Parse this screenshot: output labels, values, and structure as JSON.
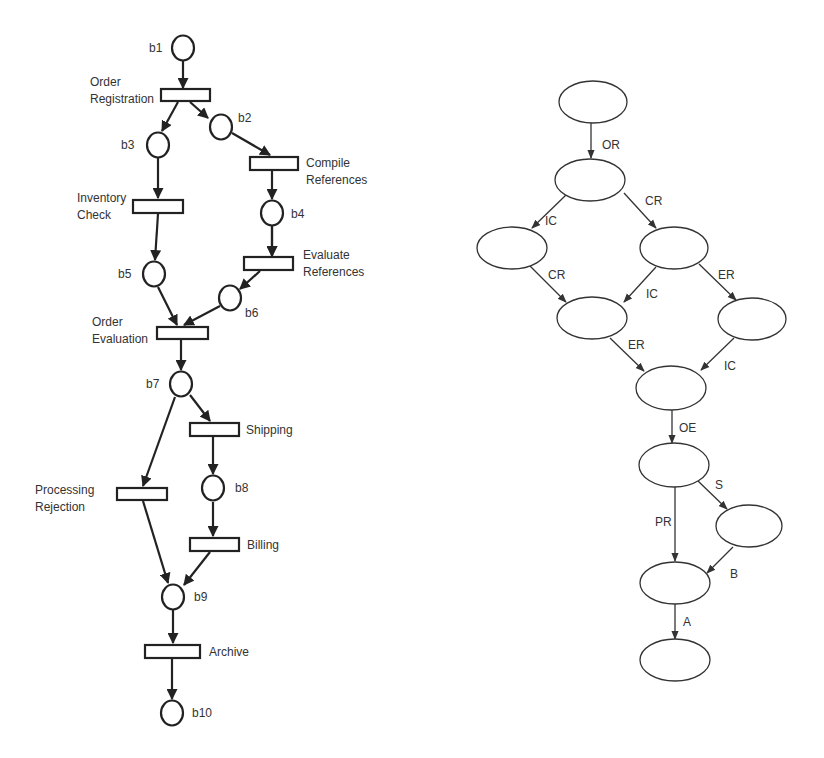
{
  "petri_net": {
    "places": [
      {
        "id": "b1",
        "label": "b1",
        "cx": 183,
        "cy": 48,
        "lx": 149,
        "ly": 52,
        "anchor": "start"
      },
      {
        "id": "b2",
        "label": "b2",
        "cx": 221,
        "cy": 127,
        "lx": 238,
        "ly": 122,
        "anchor": "start"
      },
      {
        "id": "b3",
        "label": "b3",
        "cx": 158,
        "cy": 145,
        "lx": 121,
        "ly": 149,
        "anchor": "start"
      },
      {
        "id": "b4",
        "label": "b4",
        "cx": 272,
        "cy": 213,
        "lx": 291,
        "ly": 218,
        "anchor": "start"
      },
      {
        "id": "b5",
        "label": "b5",
        "cx": 154,
        "cy": 274,
        "lx": 118,
        "ly": 278,
        "anchor": "start"
      },
      {
        "id": "b6",
        "label": "b6",
        "cx": 230,
        "cy": 298,
        "lx": 245,
        "ly": 317,
        "anchor": "start"
      },
      {
        "id": "b7",
        "label": "b7",
        "cx": 181,
        "cy": 384,
        "lx": 146,
        "ly": 388,
        "anchor": "start"
      },
      {
        "id": "b8",
        "label": "b8",
        "cx": 213,
        "cy": 488,
        "lx": 235,
        "ly": 492,
        "anchor": "start"
      },
      {
        "id": "b9",
        "label": "b9",
        "cx": 173,
        "cy": 597,
        "lx": 194,
        "ly": 601,
        "anchor": "start"
      },
      {
        "id": "b10",
        "label": "b10",
        "cx": 172,
        "cy": 713,
        "lx": 192,
        "ly": 717,
        "anchor": "start"
      }
    ],
    "transitions": [
      {
        "id": "OR",
        "lines": [
          "Order",
          "Registration"
        ],
        "x": 161,
        "y": 89,
        "w": 49,
        "h": 12,
        "lx": 90,
        "ly": 86,
        "anchor": "start"
      },
      {
        "id": "CR",
        "lines": [
          "Compile",
          "References"
        ],
        "x": 250,
        "y": 157,
        "w": 48,
        "h": 13,
        "lx": 306,
        "ly": 167,
        "anchor": "start"
      },
      {
        "id": "IC",
        "lines": [
          "Inventory",
          "Check"
        ],
        "x": 133,
        "y": 200,
        "w": 50,
        "h": 13,
        "lx": 77,
        "ly": 202,
        "anchor": "start"
      },
      {
        "id": "ER",
        "lines": [
          "Evaluate",
          "References"
        ],
        "x": 244,
        "y": 257,
        "w": 49,
        "h": 13,
        "lx": 303,
        "ly": 259,
        "anchor": "start"
      },
      {
        "id": "OE",
        "lines": [
          "Order",
          "Evaluation"
        ],
        "x": 157,
        "y": 327,
        "w": 51,
        "h": 12,
        "lx": 92,
        "ly": 326,
        "anchor": "start"
      },
      {
        "id": "S",
        "lines": [
          "Shipping"
        ],
        "x": 190,
        "y": 423,
        "w": 49,
        "h": 13,
        "lx": 246,
        "ly": 434,
        "anchor": "start"
      },
      {
        "id": "PR",
        "lines": [
          "Processing",
          "Rejection"
        ],
        "x": 117,
        "y": 488,
        "w": 50,
        "h": 12,
        "lx": 35,
        "ly": 494,
        "anchor": "start"
      },
      {
        "id": "B",
        "lines": [
          "Billing"
        ],
        "x": 190,
        "y": 538,
        "w": 49,
        "h": 13,
        "lx": 247,
        "ly": 549,
        "anchor": "start"
      },
      {
        "id": "A",
        "lines": [
          "Archive"
        ],
        "x": 145,
        "y": 645,
        "w": 55,
        "h": 13,
        "lx": 209,
        "ly": 656,
        "anchor": "start"
      }
    ],
    "arcs": [
      [
        183,
        61,
        183,
        88
      ],
      [
        178,
        102,
        162,
        131
      ],
      [
        190,
        102,
        208,
        118
      ],
      [
        232,
        133,
        270,
        155
      ],
      [
        158,
        158,
        158,
        198
      ],
      [
        272,
        171,
        272,
        199
      ],
      [
        158,
        214,
        155,
        260
      ],
      [
        272,
        201,
        272,
        256
      ],
      [
        260,
        271,
        240,
        289
      ],
      [
        272,
        226,
        272,
        256
      ],
      [
        158,
        287,
        177,
        325
      ],
      [
        220,
        306,
        184,
        325
      ],
      [
        181,
        340,
        181,
        370
      ],
      [
        190,
        395,
        210,
        421
      ],
      [
        175,
        397,
        143,
        486
      ],
      [
        213,
        437,
        213,
        474
      ],
      [
        213,
        502,
        213,
        536
      ],
      [
        143,
        501,
        168,
        583
      ],
      [
        210,
        552,
        184,
        585
      ],
      [
        173,
        610,
        173,
        643
      ],
      [
        172,
        659,
        172,
        699
      ]
    ]
  },
  "state_graph": {
    "nodes": [
      {
        "id": "s0",
        "cx": 593,
        "cy": 102,
        "rx": 34,
        "ry": 21
      },
      {
        "id": "s1",
        "cx": 590,
        "cy": 180,
        "rx": 35,
        "ry": 21
      },
      {
        "id": "s2",
        "cx": 512,
        "cy": 248,
        "rx": 35,
        "ry": 21
      },
      {
        "id": "s3",
        "cx": 674,
        "cy": 248,
        "rx": 34,
        "ry": 21
      },
      {
        "id": "s4",
        "cx": 592,
        "cy": 318,
        "rx": 35,
        "ry": 21
      },
      {
        "id": "s5",
        "cx": 752,
        "cy": 319,
        "rx": 34,
        "ry": 21
      },
      {
        "id": "s6",
        "cx": 671,
        "cy": 388,
        "rx": 35,
        "ry": 22
      },
      {
        "id": "s7",
        "cx": 674,
        "cy": 465,
        "rx": 35,
        "ry": 22
      },
      {
        "id": "s8",
        "cx": 749,
        "cy": 526,
        "rx": 33,
        "ry": 21
      },
      {
        "id": "s9",
        "cx": 675,
        "cy": 583,
        "rx": 35,
        "ry": 21
      },
      {
        "id": "s10",
        "cx": 675,
        "cy": 660,
        "rx": 35,
        "ry": 21
      }
    ],
    "edges": [
      {
        "label": "OR",
        "x1": 591,
        "y1": 123,
        "x2": 591,
        "y2": 158,
        "lx": 602,
        "ly": 149
      },
      {
        "label": "IC",
        "x1": 566,
        "y1": 195,
        "x2": 532,
        "y2": 228,
        "lx": 545,
        "ly": 225
      },
      {
        "label": "CR",
        "x1": 624,
        "y1": 193,
        "x2": 656,
        "y2": 228,
        "lx": 645,
        "ly": 205
      },
      {
        "label": "CR",
        "x1": 530,
        "y1": 266,
        "x2": 566,
        "y2": 302,
        "lx": 548,
        "ly": 279
      },
      {
        "label": "IC",
        "x1": 656,
        "y1": 267,
        "x2": 624,
        "y2": 302,
        "lx": 646,
        "ly": 298
      },
      {
        "label": "ER",
        "x1": 699,
        "y1": 264,
        "x2": 736,
        "y2": 300,
        "lx": 718,
        "ly": 279
      },
      {
        "label": "ER",
        "x1": 610,
        "y1": 338,
        "x2": 644,
        "y2": 371,
        "lx": 628,
        "ly": 349
      },
      {
        "label": "IC",
        "x1": 734,
        "y1": 338,
        "x2": 701,
        "y2": 370,
        "lx": 724,
        "ly": 370
      },
      {
        "label": "OE",
        "x1": 672,
        "y1": 410,
        "x2": 672,
        "y2": 443,
        "lx": 679,
        "ly": 432
      },
      {
        "label": "S",
        "x1": 698,
        "y1": 481,
        "x2": 727,
        "y2": 509,
        "lx": 715,
        "ly": 489
      },
      {
        "label": "PR",
        "x1": 675,
        "y1": 487,
        "x2": 675,
        "y2": 561,
        "lx": 655,
        "ly": 526
      },
      {
        "label": "B",
        "x1": 733,
        "y1": 547,
        "x2": 707,
        "y2": 573,
        "lx": 730,
        "ly": 578
      },
      {
        "label": "A",
        "x1": 675,
        "y1": 604,
        "x2": 675,
        "y2": 639,
        "lx": 683,
        "ly": 626
      }
    ]
  }
}
